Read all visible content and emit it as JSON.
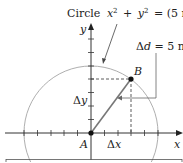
{
  "diagram": {
    "circle_label": {
      "word": "Circle",
      "x": "x",
      "plus": "+",
      "y": "y",
      "eq": "= (5 m)",
      "exp": "2"
    },
    "axis_labels": {
      "x": "x",
      "y": "y"
    },
    "points": {
      "origin": "A",
      "end": "B"
    },
    "displacement_label": {
      "delta": "Δ",
      "d": "d",
      "value": " = 5 m"
    },
    "delta_x": {
      "delta": "Δ",
      "var": "x"
    },
    "delta_y": {
      "delta": "Δ",
      "var": "y"
    },
    "geometry": {
      "radius_units": 5,
      "B_coords": [
        3,
        4
      ],
      "tick_spacing_units": 1
    },
    "colors": {
      "line": "#333333",
      "circle": "#999999",
      "vector": "#777777"
    }
  }
}
